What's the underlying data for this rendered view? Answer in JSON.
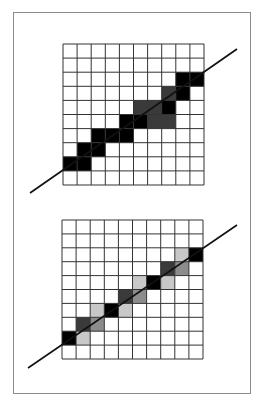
{
  "figure": {
    "grid_size": 10,
    "colors": {
      "grid_line": "#333333",
      "line": "#111111",
      "frame": "#8a8a8a",
      "black": "#000000",
      "dark": "#3a3a3a",
      "mid": "#8c8c8c",
      "light": "#c8c8c8"
    },
    "panels": [
      {
        "name": "aliased",
        "grid": {
          "x": 63,
          "y": 44,
          "w": 141,
          "h": 141
        },
        "line": {
          "x1": 30,
          "y1": 193,
          "x2": 237,
          "y2": 49
        },
        "cells": [
          {
            "r": 8,
            "c": 0,
            "shade": "black"
          },
          {
            "r": 8,
            "c": 1,
            "shade": "black"
          },
          {
            "r": 7,
            "c": 1,
            "shade": "black"
          },
          {
            "r": 7,
            "c": 2,
            "shade": "black"
          },
          {
            "r": 6,
            "c": 2,
            "shade": "black"
          },
          {
            "r": 6,
            "c": 3,
            "shade": "black"
          },
          {
            "r": 6,
            "c": 4,
            "shade": "black"
          },
          {
            "r": 5,
            "c": 4,
            "shade": "black"
          },
          {
            "r": 5,
            "c": 5,
            "shade": "black"
          },
          {
            "r": 5,
            "c": 6,
            "shade": "dark"
          },
          {
            "r": 5,
            "c": 7,
            "shade": "dark"
          },
          {
            "r": 4,
            "c": 5,
            "shade": "dark"
          },
          {
            "r": 4,
            "c": 6,
            "shade": "dark"
          },
          {
            "r": 4,
            "c": 7,
            "shade": "black"
          },
          {
            "r": 3,
            "c": 7,
            "shade": "dark"
          },
          {
            "r": 3,
            "c": 8,
            "shade": "black"
          },
          {
            "r": 2,
            "c": 8,
            "shade": "black"
          },
          {
            "r": 2,
            "c": 9,
            "shade": "black"
          }
        ]
      },
      {
        "name": "antialiased",
        "grid": {
          "x": 62,
          "y": 220,
          "w": 141,
          "h": 139
        },
        "line": {
          "x1": 28,
          "y1": 368,
          "x2": 237,
          "y2": 225
        },
        "cells": [
          {
            "r": 8,
            "c": 0,
            "shade": "black"
          },
          {
            "r": 8,
            "c": 1,
            "shade": "light"
          },
          {
            "r": 7,
            "c": 1,
            "shade": "dark"
          },
          {
            "r": 7,
            "c": 2,
            "shade": "mid"
          },
          {
            "r": 6,
            "c": 2,
            "shade": "light"
          },
          {
            "r": 6,
            "c": 3,
            "shade": "black"
          },
          {
            "r": 6,
            "c": 4,
            "shade": "light"
          },
          {
            "r": 5,
            "c": 4,
            "shade": "dark"
          },
          {
            "r": 5,
            "c": 5,
            "shade": "mid"
          },
          {
            "r": 4,
            "c": 5,
            "shade": "light"
          },
          {
            "r": 4,
            "c": 6,
            "shade": "black"
          },
          {
            "r": 4,
            "c": 7,
            "shade": "light"
          },
          {
            "r": 3,
            "c": 7,
            "shade": "dark"
          },
          {
            "r": 3,
            "c": 8,
            "shade": "mid"
          },
          {
            "r": 2,
            "c": 8,
            "shade": "light"
          },
          {
            "r": 2,
            "c": 9,
            "shade": "black"
          }
        ]
      }
    ]
  }
}
